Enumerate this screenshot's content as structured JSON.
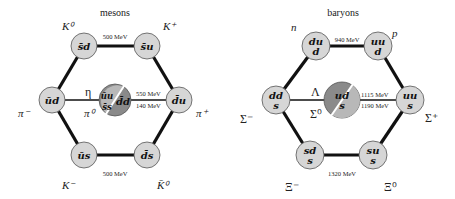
{
  "panels": [
    {
      "id": "mesons",
      "title": "mesons",
      "edge_labels": {
        "top": "500 MeV",
        "bottom": "500 MeV",
        "center_upper": "550 MeV",
        "center_lower": "140 MeV"
      },
      "nodes": {
        "top_left": {
          "quark_top": "s̄d",
          "quark_bottom": "",
          "particle": "K⁰"
        },
        "top_right": {
          "quark_top": "s̄u",
          "quark_bottom": "",
          "particle": "K⁺"
        },
        "left": {
          "quark_top": "ūd",
          "quark_bottom": "",
          "particle": "π⁻"
        },
        "right": {
          "quark_top": "d̄u",
          "quark_bottom": "",
          "particle": "π⁺"
        },
        "bottom_left": {
          "quark_top": "ūs",
          "quark_bottom": "",
          "particle": "K⁻"
        },
        "bottom_right": {
          "quark_top": "d̄s",
          "quark_bottom": "",
          "particle": "K̄⁰"
        },
        "center": {
          "quark_a": "ūu",
          "quark_b": "s̄s",
          "quark_c": "d̄d",
          "particle_upper": "η",
          "particle_lower": "π⁰"
        }
      }
    },
    {
      "id": "baryons",
      "title": "baryons",
      "edge_labels": {
        "top": "940 MeV",
        "bottom": "1320 MeV",
        "center_upper": "1115 MeV",
        "center_lower": "1190 MeV"
      },
      "nodes": {
        "top_left": {
          "quark_top": "du",
          "quark_bottom": "d",
          "particle": "n"
        },
        "top_right": {
          "quark_top": "uu",
          "quark_bottom": "d",
          "particle": "p"
        },
        "left": {
          "quark_top": "dd",
          "quark_bottom": "s",
          "particle": "Σ⁻"
        },
        "right": {
          "quark_top": "uu",
          "quark_bottom": "s",
          "particle": "Σ⁺"
        },
        "bottom_left": {
          "quark_top": "sd",
          "quark_bottom": "s",
          "particle": "Ξ⁻"
        },
        "bottom_right": {
          "quark_top": "su",
          "quark_bottom": "s",
          "particle": "Ξ⁰"
        },
        "center": {
          "quark_a": "ud",
          "quark_b": "s",
          "particle_upper": "Λ",
          "particle_lower": "Σ⁰"
        }
      }
    }
  ],
  "colors": {
    "node_fill": "#d6d6d6",
    "center_dark": "#8a8a8a",
    "center_light": "#b8b8b8",
    "edge": "#111111"
  }
}
